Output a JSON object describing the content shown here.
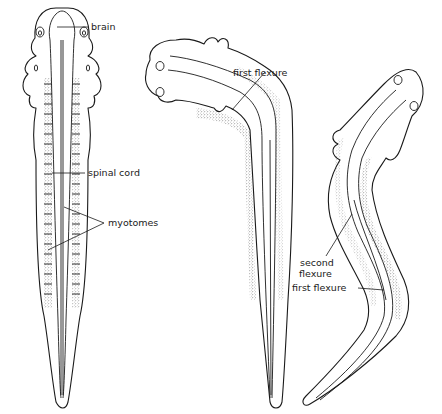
{
  "figure": {
    "colors": {
      "ink": "#1a1a1a",
      "background": "#ffffff"
    }
  },
  "embryos": [
    {
      "id": "straight",
      "labels": {
        "brain": "brain",
        "spinal_cord": "spinal cord",
        "myotomes": "myotomes"
      }
    },
    {
      "id": "bent-once",
      "labels": {
        "first_flexure": "first flexure"
      }
    },
    {
      "id": "s-curve",
      "labels": {
        "second_flexure_line1": "second",
        "second_flexure_line2": "flexure",
        "first_flexure": "first flexure"
      }
    }
  ]
}
